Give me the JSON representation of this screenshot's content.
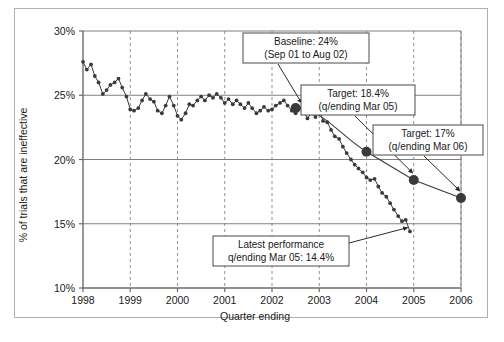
{
  "chart_data": {
    "type": "line",
    "title": "",
    "xlabel": "Quarter ending",
    "ylabel": "% of trials that are ineffective",
    "xlim": [
      1998,
      2006
    ],
    "ylim": [
      10,
      30
    ],
    "y_tick_labels": [
      "10%",
      "15%",
      "20%",
      "25%",
      "30%"
    ],
    "y_ticks": [
      10,
      15,
      20,
      25,
      30
    ],
    "x_tick_labels": [
      "1998",
      "1999",
      "2000",
      "2001",
      "2002",
      "2003",
      "2004",
      "2005",
      "2006"
    ],
    "x_ticks": [
      1998,
      1999,
      2000,
      2001,
      2002,
      2003,
      2004,
      2005,
      2006
    ],
    "grid": "vertical dashed at each year except 1998; horizontal solid at 15%, 20%, 25%",
    "legend": "none",
    "series": [
      {
        "name": "Monthly rolling performance",
        "marker": "small filled circle",
        "color": "#3a3a3a",
        "x": [
          1998.0,
          1998.08,
          1998.17,
          1998.25,
          1998.33,
          1998.42,
          1998.5,
          1998.58,
          1998.67,
          1998.75,
          1998.83,
          1998.92,
          1999.0,
          1999.08,
          1999.17,
          1999.25,
          1999.33,
          1999.42,
          1999.5,
          1999.58,
          1999.67,
          1999.75,
          1999.83,
          1999.92,
          2000.0,
          2000.08,
          2000.17,
          2000.25,
          2000.33,
          2000.42,
          2000.5,
          2000.58,
          2000.67,
          2000.75,
          2000.83,
          2000.92,
          2001.0,
          2001.08,
          2001.17,
          2001.25,
          2001.33,
          2001.42,
          2001.5,
          2001.58,
          2001.67,
          2001.75,
          2001.83,
          2001.92,
          2002.0,
          2002.08,
          2002.17,
          2002.25,
          2002.33,
          2002.42,
          2002.5,
          2002.58,
          2002.67,
          2002.75,
          2002.83,
          2002.92,
          2003.0,
          2003.08,
          2003.17,
          2003.25,
          2003.33,
          2003.42,
          2003.5,
          2003.58,
          2003.67,
          2003.75,
          2003.83,
          2003.92,
          2004.0,
          2004.08,
          2004.17,
          2004.25,
          2004.33,
          2004.42,
          2004.5,
          2004.58,
          2004.67,
          2004.75,
          2004.83,
          2004.92
        ],
        "values": [
          27.6,
          27.0,
          27.4,
          26.5,
          26.0,
          25.1,
          25.4,
          25.8,
          26.0,
          26.3,
          25.6,
          24.9,
          23.9,
          23.8,
          24.0,
          24.6,
          25.1,
          24.7,
          24.5,
          23.8,
          23.6,
          24.2,
          24.9,
          24.2,
          23.4,
          23.1,
          23.6,
          24.3,
          24.2,
          24.6,
          24.9,
          24.6,
          25.0,
          24.8,
          25.1,
          24.8,
          24.4,
          24.7,
          24.3,
          24.6,
          24.3,
          24.0,
          24.4,
          24.0,
          23.6,
          23.8,
          24.1,
          23.8,
          23.9,
          24.2,
          24.4,
          24.6,
          24.2,
          23.8,
          23.6,
          24.0,
          23.7,
          23.2,
          23.6,
          23.3,
          23.9,
          23.0,
          22.9,
          22.3,
          21.8,
          21.6,
          21.0,
          20.5,
          20.0,
          19.6,
          19.3,
          19.0,
          18.6,
          18.4,
          18.5,
          17.9,
          17.4,
          17.1,
          16.6,
          16.1,
          15.6,
          15.2,
          15.3,
          14.4
        ]
      },
      {
        "name": "Baseline and target trajectory",
        "marker": "large filled circle",
        "color": "#3a3a3a",
        "x": [
          2002.5,
          2004.0,
          2005.0,
          2006.0
        ],
        "values": [
          24.0,
          20.6,
          18.4,
          17.0
        ],
        "point_labels": [
          "Baseline: 24%",
          "",
          "Target: 18.4%",
          "Target: 17%"
        ]
      }
    ],
    "annotations": [
      {
        "name": "baseline-callout",
        "lines": [
          "Baseline: 24%",
          "(Sep 01 to Aug 02)"
        ],
        "points_to": {
          "x": 2002.5,
          "y": 24.0
        }
      },
      {
        "name": "target-2005-callout",
        "lines": [
          "Target: 18.4%",
          "(q/ending Mar 05)"
        ],
        "points_to": {
          "x": 2005.0,
          "y": 18.4
        }
      },
      {
        "name": "target-2006-callout",
        "lines": [
          "Target: 17%",
          "(q/ending Mar 06)"
        ],
        "points_to": {
          "x": 2006.0,
          "y": 17.0
        }
      },
      {
        "name": "latest-performance-callout",
        "lines": [
          "Latest performance",
          "q/ending Mar 05: 14.4%"
        ],
        "points_to": {
          "x": 2004.92,
          "y": 14.4
        }
      }
    ]
  },
  "axis": {
    "y_label": "% of trials that are ineffective",
    "x_label": "Quarter ending",
    "y_ticks": [
      "30%",
      "25%",
      "20%",
      "15%",
      "10%"
    ],
    "x_ticks": [
      "1998",
      "1999",
      "2000",
      "2001",
      "2002",
      "2003",
      "2004",
      "2005",
      "2006"
    ]
  },
  "callouts": {
    "baseline": {
      "line1": "Baseline: 24%",
      "line2": "(Sep 01 to Aug 02)"
    },
    "target_mar05": {
      "line1": "Target: 18.4%",
      "line2": "(q/ending Mar 05)"
    },
    "target_mar06": {
      "line1": "Target: 17%",
      "line2": "(q/ending Mar 06)"
    },
    "latest": {
      "line1": "Latest performance",
      "line2": "q/ending Mar 05: 14.4%"
    }
  },
  "colors": {
    "series": "#3a3a3a",
    "gridline_solid": "#808080",
    "gridline_dashed": "#909090",
    "axis": "#6b6b6b",
    "frame": "#b0b0b0",
    "callout_border": "#4a4a4a",
    "text": "#1a1a1a",
    "background": "#ffffff"
  }
}
